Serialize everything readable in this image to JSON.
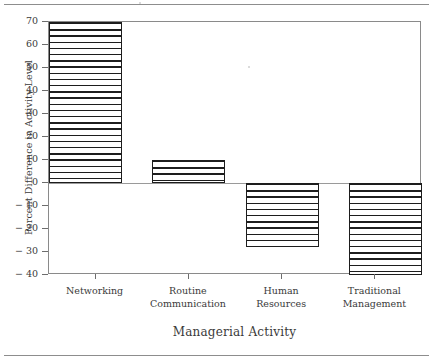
{
  "chart_data": {
    "type": "bar",
    "title": "",
    "xlabel": "Managerial Activity",
    "ylabel": "Percent Difference in Activity Level",
    "categories": [
      "Networking",
      "Routine Communication",
      "Human Resources",
      "Traditional Management"
    ],
    "category_lines": [
      [
        "Networking"
      ],
      [
        "Routine",
        "Communication"
      ],
      [
        "Human",
        "Resources"
      ],
      [
        "Traditional",
        "Management"
      ]
    ],
    "values": [
      70,
      10,
      -28,
      -40
    ],
    "ylim": [
      -40,
      70
    ],
    "yticks": [
      70,
      60,
      50,
      40,
      30,
      20,
      10,
      0,
      -10,
      -20,
      -30,
      -40
    ],
    "ytick_labels": [
      "70",
      "60",
      "50",
      "40",
      "30",
      "20",
      "10",
      "0",
      "− 10",
      "− 20",
      "− 30",
      "− 40"
    ],
    "grid": false,
    "legend": null,
    "bar_fill": "horizontal-hatch",
    "bar_edge_color": "#1d1d1d",
    "frame_color": "#8a8a8a",
    "zero_line": 0
  },
  "figure": {
    "top_rule": "horizontal-rule",
    "bottom_rule": "horizontal-rule"
  }
}
